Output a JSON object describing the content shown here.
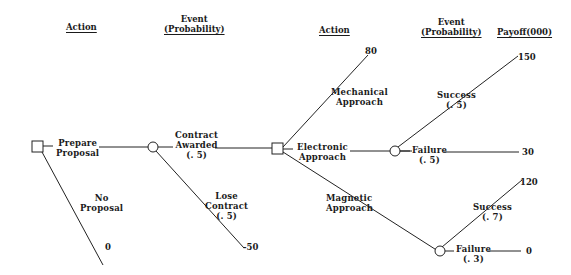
{
  "headers": {
    "action_1": "Action",
    "event_1_line1": "Event",
    "event_1_line2": "(Probability)",
    "action_2": "Action",
    "event_2_line1": "Event",
    "event_2_line2": "(Probability)",
    "payoff": "Payoff(000)"
  },
  "nodes": {
    "decision_1": {
      "type": "decision",
      "shape": "square-icon"
    },
    "chance_1": {
      "type": "chance",
      "shape": "circle-icon"
    },
    "decision_2": {
      "type": "decision",
      "shape": "square-icon"
    },
    "chance_2": {
      "type": "chance",
      "shape": "circle-icon"
    },
    "chance_3": {
      "type": "chance",
      "shape": "circle-icon"
    }
  },
  "branches": {
    "prepare_proposal": {
      "line1": "Prepare",
      "line2": "Proposal"
    },
    "no_proposal": {
      "line1": "No",
      "line2": "Proposal",
      "payoff": "0"
    },
    "contract_awarded": {
      "line1": "Contract",
      "line2": "Awarded",
      "prob": "(. 5)"
    },
    "lose_contract": {
      "line1": "Lose",
      "line2": "Contract",
      "prob": "(. 5)",
      "payoff": "-50"
    },
    "mechanical": {
      "line1": "Mechanical",
      "line2": "Approach",
      "payoff": "80"
    },
    "electronic": {
      "line1": "Electronic",
      "line2": "Approach"
    },
    "magnetic": {
      "line1": "Magnetic",
      "line2": "Approach"
    },
    "electronic_success": {
      "line1": "Success",
      "prob": "(. 5)",
      "payoff": "150"
    },
    "electronic_failure": {
      "line1": "Failure",
      "prob": "(. 5)",
      "payoff": "30"
    },
    "magnetic_success": {
      "line1": "Success",
      "prob": "(. 7)",
      "payoff": "120"
    },
    "magnetic_failure": {
      "line1": "Failure",
      "prob": "(. 3)",
      "payoff": "0"
    }
  }
}
